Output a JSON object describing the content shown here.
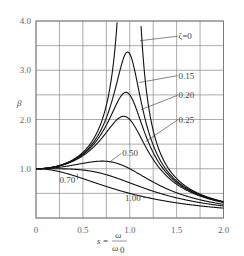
{
  "chart_data": {
    "type": "line",
    "title": "",
    "xlabel": "s = ω / ω0",
    "xlabel_parts": {
      "lhs": "s",
      "eq": "=",
      "num": "ω",
      "den": "ω",
      "den_sub": "0"
    },
    "ylabel": "β",
    "xlim": [
      0,
      2.0
    ],
    "ylim": [
      0,
      4.0
    ],
    "x_ticks": [
      0,
      0.5,
      1.0,
      1.5,
      2.0
    ],
    "x_tick_labels": [
      "0",
      "0.5",
      "1.0",
      "1.5",
      "2.0"
    ],
    "y_ticks": [
      1.0,
      2.0,
      3.0,
      4.0
    ],
    "y_tick_labels": [
      "1.0",
      "2.0",
      "3.0",
      "4.0"
    ],
    "grid": true,
    "grid_x_step": 0.25,
    "grid_y_step": 0.5,
    "legend": "inline labels",
    "formula": "β = 1 / sqrt((1 - s²)² + (2ζs)²)",
    "series": [
      {
        "name": "ζ=0",
        "label": "ζ=0",
        "zeta": 0.0,
        "x": [
          0,
          0.25,
          0.5,
          0.75,
          0.82,
          1.11,
          1.25,
          1.5,
          1.75,
          2.0
        ],
        "values": [
          1.0,
          1.07,
          1.33,
          2.29,
          3.05,
          4.0,
          1.78,
          0.8,
          0.48,
          0.33
        ]
      },
      {
        "name": "ζ=0.15",
        "label": "0.15",
        "zeta": 0.15,
        "x": [
          0,
          0.25,
          0.5,
          0.75,
          0.98,
          1.25,
          1.5,
          1.75,
          2.0
        ],
        "values": [
          1.0,
          1.06,
          1.3,
          1.99,
          3.37,
          1.55,
          0.77,
          0.47,
          0.33
        ]
      },
      {
        "name": "ζ=0.20",
        "label": "0.20",
        "zeta": 0.2,
        "x": [
          0,
          0.25,
          0.5,
          0.75,
          0.96,
          1.25,
          1.5,
          1.75,
          2.0
        ],
        "values": [
          1.0,
          1.06,
          1.28,
          1.86,
          2.55,
          1.43,
          0.75,
          0.46,
          0.32
        ]
      },
      {
        "name": "ζ=0.25",
        "label": "0.25",
        "zeta": 0.25,
        "x": [
          0,
          0.25,
          0.5,
          0.75,
          0.94,
          1.25,
          1.5,
          1.75,
          2.0
        ],
        "values": [
          1.0,
          1.06,
          1.26,
          1.72,
          2.07,
          1.31,
          0.73,
          0.45,
          0.32
        ]
      },
      {
        "name": "ζ=0.50",
        "label": "0.50",
        "zeta": 0.5,
        "x": [
          0,
          0.25,
          0.5,
          0.71,
          1.0,
          1.25,
          1.5,
          1.75,
          2.0
        ],
        "values": [
          1.0,
          1.03,
          1.11,
          1.15,
          1.0,
          0.72,
          0.55,
          0.39,
          0.28
        ]
      },
      {
        "name": "ζ=0.70",
        "label": "0.70",
        "zeta": 0.7,
        "x": [
          0,
          0.25,
          0.5,
          0.75,
          1.0,
          1.25,
          1.5,
          1.75,
          2.0
        ],
        "values": [
          1.0,
          1.0,
          0.97,
          0.89,
          0.71,
          0.53,
          0.4,
          0.3,
          0.24
        ]
      },
      {
        "name": "ζ=1.00",
        "label": "1.00",
        "zeta": 1.0,
        "x": [
          0,
          0.25,
          0.5,
          0.75,
          1.0,
          1.25,
          1.5,
          1.75,
          2.0
        ],
        "values": [
          1.0,
          0.94,
          0.8,
          0.64,
          0.5,
          0.39,
          0.31,
          0.25,
          0.2
        ]
      }
    ],
    "annotations": [
      {
        "text": "ζ=0",
        "x": 1.52,
        "y": 3.63,
        "leader_to": [
          1.11,
          3.6
        ]
      },
      {
        "text": "0.15",
        "x": 1.52,
        "y": 2.83,
        "leader_to": [
          1.1,
          2.75
        ]
      },
      {
        "text": "0.20",
        "x": 1.52,
        "y": 2.43,
        "leader_to": [
          1.12,
          2.2
        ]
      },
      {
        "text": "0.25",
        "x": 1.52,
        "y": 1.93,
        "leader_to": [
          1.17,
          1.55
        ]
      },
      {
        "text": "0.50",
        "x": 0.92,
        "y": 1.25,
        "leader_to": [
          0.78,
          1.13
        ]
      },
      {
        "text": "0.70",
        "x": 0.25,
        "y": 0.72,
        "leader_to": [
          0.44,
          0.9
        ]
      },
      {
        "text": "1.00",
        "x": 0.95,
        "y": 0.35,
        "leader_to": [
          1.22,
          0.42
        ]
      }
    ]
  }
}
